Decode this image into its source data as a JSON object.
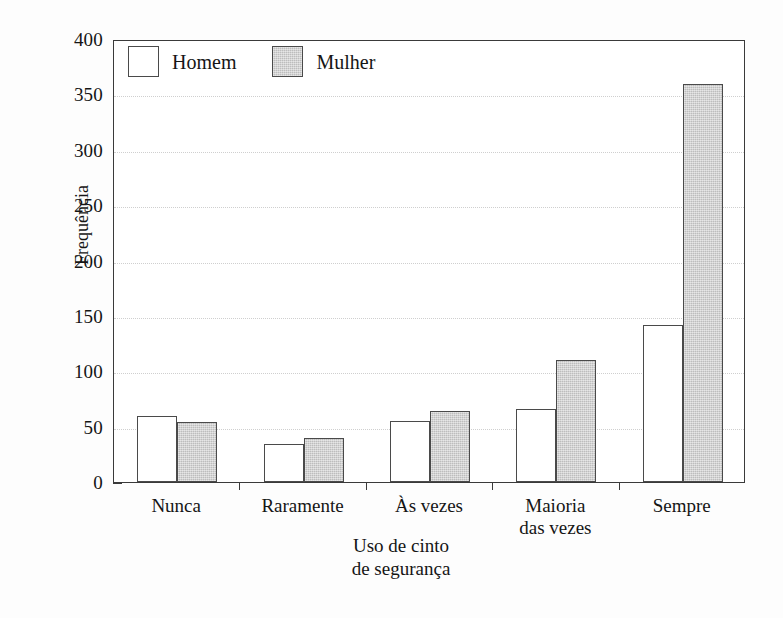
{
  "chart_data": {
    "type": "bar",
    "title": "",
    "subtitle": "",
    "xlabel": "Uso de cinto\nde segurança",
    "ylabel": "Frequência",
    "categories": [
      "Nunca",
      "Raramente",
      "Às vezes",
      "Maioria\ndas vezes",
      "Sempre"
    ],
    "series": [
      {
        "name": "Homem",
        "values": [
          60,
          34,
          55,
          66,
          142
        ],
        "color": "#ffffff"
      },
      {
        "name": "Mulher",
        "values": [
          54,
          40,
          64,
          110,
          359
        ],
        "color": "#cbcbcb"
      }
    ],
    "ylim": [
      0,
      400
    ],
    "ytick_labels": [
      "0",
      "50",
      "100",
      "150",
      "200",
      "250",
      "300",
      "350",
      "400"
    ],
    "ytick_values": [
      0,
      50,
      100,
      150,
      200,
      250,
      300,
      350,
      400
    ],
    "yminor_values": [
      25,
      75,
      125,
      175,
      225,
      275,
      325,
      375
    ],
    "grid": true,
    "grid_axis": "y",
    "legend_position": "top-left",
    "legend_entries": [
      "Homem",
      "Mulher"
    ],
    "annotations": []
  },
  "colors": {
    "axis": "#3a3a3a",
    "bar_edge": "#4a4a4a",
    "homem_fill": "#ffffff",
    "mulher_fill": "#cbcbcb",
    "gridline": "#cfcfcf",
    "text": "#151515",
    "background": "#fdfdfd"
  }
}
